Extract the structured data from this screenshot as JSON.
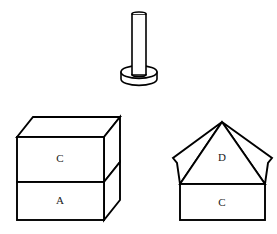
{
  "figure": {
    "background_color": "#ffffff",
    "stroke_color": "#000000",
    "fill_color": "#ffffff",
    "label_color": "#1a1a1a",
    "width": 277,
    "height": 234
  },
  "objects": {
    "cylinder_post": {
      "name": "cylindrical post on disc base",
      "description": "vertical rod standing on a flat round base",
      "post_left_x": 132,
      "post_right_x": 146,
      "post_top_y": 12,
      "post_bottom_y": 76,
      "base_center_x": 139,
      "base_top_y": 72,
      "base_rx": 18,
      "base_ry": 6,
      "base_height": 9,
      "labels": []
    },
    "stacked_cube": {
      "name": "stacked rectangular blocks",
      "description": "cube drawn in oblique projection split into two stacked blocks",
      "front_left_x": 17,
      "front_right_x": 104,
      "front_top_y": 137,
      "front_bottom_y": 220,
      "depth_dx": 16,
      "depth_dy": -20,
      "divider_y": 182,
      "labels": [
        {
          "text": "C",
          "x": 60,
          "y": 158,
          "face": "upper-front"
        },
        {
          "text": "A",
          "x": 60,
          "y": 200,
          "face": "lower-front"
        }
      ]
    },
    "pyramid_house": {
      "name": "pyramid roof on rectangular base",
      "description": "house-like solid: box base topped by a four-sided pyramid",
      "base_left_x": 180,
      "base_right_x": 265,
      "base_top_y": 184,
      "base_bottom_y": 220,
      "apex_x": 222,
      "apex_y": 122,
      "left_wing_x": 173,
      "left_wing_y": 158,
      "right_wing_x": 272,
      "right_wing_y": 158,
      "labels": [
        {
          "text": "D",
          "x": 222,
          "y": 157,
          "face": "roof-front"
        },
        {
          "text": "C",
          "x": 222,
          "y": 202,
          "face": "base-front"
        }
      ]
    }
  },
  "labels_list": [
    {
      "letter": "C",
      "object": "stacked-cube-upper-block"
    },
    {
      "letter": "A",
      "object": "stacked-cube-lower-block"
    },
    {
      "letter": "D",
      "object": "pyramid-roof"
    },
    {
      "letter": "C",
      "object": "pyramid-house-base"
    }
  ]
}
